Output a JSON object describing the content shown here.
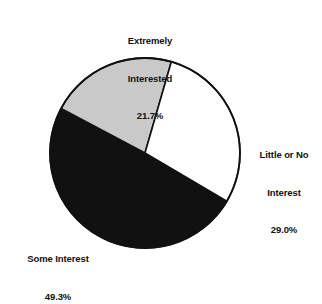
{
  "chart_data": {
    "type": "pie",
    "title": "",
    "categories": [
      "Extremely Interested",
      "Little or No Interest",
      "Some Interest"
    ],
    "values": [
      21.7,
      29.0,
      49.3
    ],
    "value_suffix": "%",
    "slices": [
      {
        "name": "extremely-interested",
        "label_line1": "Extremely",
        "label_line2": "Interested",
        "value_text": "21.7%",
        "value": 21.7,
        "fill": "#c9c9c9",
        "stroke": "#111111",
        "start_angle_deg": -62.0,
        "end_angle_deg": 16.1
      },
      {
        "name": "little-or-no-interest",
        "label_line1": "Little or No",
        "label_line2": "Interest",
        "value_text": "29.0%",
        "value": 29.0,
        "fill": "#ffffff",
        "stroke": "#111111",
        "start_angle_deg": 16.1,
        "end_angle_deg": 120.5
      },
      {
        "name": "some-interest",
        "label_line1": "Some Interest",
        "label_line2": "",
        "value_text": "49.3%",
        "value": 49.3,
        "fill": "#111111",
        "stroke": "#111111",
        "start_angle_deg": 120.5,
        "end_angle_deg": 298.0
      }
    ],
    "geometry": {
      "center_x": 145,
      "center_y": 153,
      "radius": 95
    },
    "legend": "none",
    "grid": false
  },
  "labels": {
    "extremely": {
      "line1": "Extremely",
      "line2": "Interested",
      "percent": "21.7%"
    },
    "little": {
      "line1": "Little or No",
      "line2": "Interest",
      "percent": "29.0%"
    },
    "some": {
      "line1": "Some Interest",
      "percent": "49.3%"
    }
  },
  "colors": {
    "gray_slice": "#c9c9c9",
    "black_slice": "#111111",
    "white_slice": "#ffffff",
    "outline": "#111111",
    "text": "#111111",
    "background": "#ffffff"
  }
}
